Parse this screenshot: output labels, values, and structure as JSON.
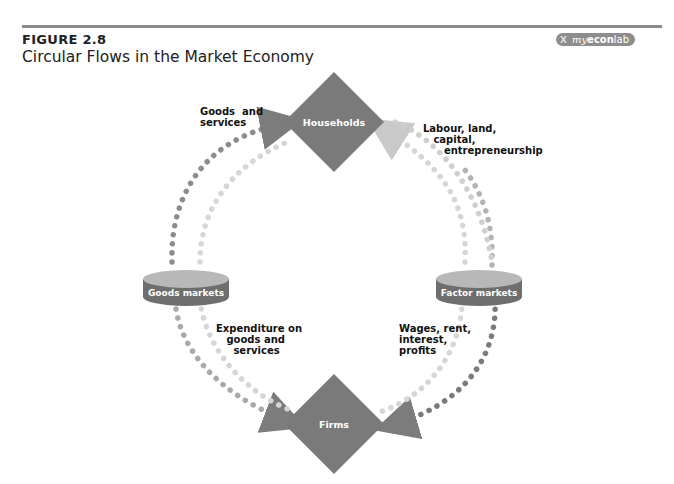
{
  "header": {
    "figure_label": "FIGURE 2.8",
    "figure_title": "Circular Flows in the Market Economy",
    "badge": {
      "prefix": "X",
      "my": "my",
      "econ": "econ",
      "lab": "lab"
    }
  },
  "nodes": {
    "households": "Households",
    "firms": "Firms",
    "goods_markets": "Goods markets",
    "factor_markets": "Factor markets"
  },
  "flows": {
    "goods_services_top": "Goods  and\nservices",
    "factors_top": "Labour, land,\n   capital,\n      entrepreneurship",
    "expenditure": "Expenditure on\n   goods and\n     services",
    "incomes": "Wages, rent,\ninterest,\nprofits"
  },
  "colors": {
    "diamond": "#7a7a7a",
    "market_top": "#b5b5b5",
    "market_band": "#707070",
    "real_flow_dots": "#8c8c8c",
    "money_flow_dots": "#d6d6d6"
  }
}
